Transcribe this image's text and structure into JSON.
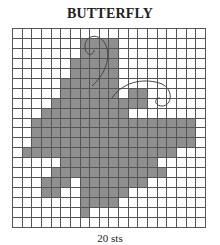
{
  "title": "BUTTERFLY",
  "caption": "20 sts",
  "grid": {
    "columns": 20,
    "rows": 20,
    "fill_color": "#8f8f8f",
    "line_color": "#555555",
    "filled_ranges_by_row": [
      [],
      [
        [
          7,
          10
        ]
      ],
      [
        [
          7,
          10
        ]
      ],
      [
        [
          6,
          10
        ]
      ],
      [
        [
          6,
          10
        ]
      ],
      [
        [
          5,
          10
        ]
      ],
      [
        [
          5,
          10
        ],
        [
          12,
          13
        ]
      ],
      [
        [
          4,
          13
        ]
      ],
      [
        [
          3,
          11
        ]
      ],
      [
        [
          2,
          18
        ]
      ],
      [
        [
          2,
          18
        ]
      ],
      [
        [
          2,
          18
        ]
      ],
      [
        [
          1,
          16
        ]
      ],
      [
        [
          5,
          14
        ]
      ],
      [
        [
          4,
          15
        ]
      ],
      [
        [
          3,
          5
        ],
        [
          7,
          13
        ]
      ],
      [
        [
          3,
          4
        ],
        [
          7,
          11
        ]
      ],
      [
        [
          7,
          10
        ]
      ],
      [
        [
          7,
          7
        ]
      ],
      []
    ]
  },
  "decorations": [
    "antenna-upper",
    "antenna-lower"
  ]
}
